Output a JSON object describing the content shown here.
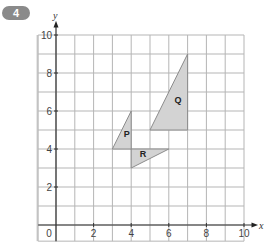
{
  "question": {
    "number": "4"
  },
  "chart_data": {
    "type": "scatter",
    "title": "",
    "xlabel": "x",
    "ylabel": "y",
    "xlim": [
      0,
      10
    ],
    "ylim": [
      0,
      10
    ],
    "grid": true,
    "x_ticks": [
      "2",
      "4",
      "6",
      "8",
      "10"
    ],
    "y_ticks": [
      "2",
      "4",
      "6",
      "8",
      "10"
    ],
    "origin_label": "0",
    "shapes": [
      {
        "label": "P",
        "type": "triangle",
        "vertices": [
          [
            3,
            4
          ],
          [
            4,
            4
          ],
          [
            4,
            6
          ]
        ],
        "label_pos": [
          3.6,
          4.65
        ]
      },
      {
        "label": "Q",
        "type": "triangle",
        "vertices": [
          [
            5,
            5
          ],
          [
            7,
            5
          ],
          [
            7,
            9
          ]
        ],
        "label_pos": [
          6.3,
          6.4
        ]
      },
      {
        "label": "R",
        "type": "triangle",
        "vertices": [
          [
            4,
            4
          ],
          [
            6,
            4
          ],
          [
            4,
            3
          ]
        ],
        "label_pos": [
          4.45,
          3.6
        ]
      }
    ],
    "fill_color": "#d3d3d3",
    "stroke_color": "#8c8c8c",
    "grid_color": "#b5b5b5"
  }
}
